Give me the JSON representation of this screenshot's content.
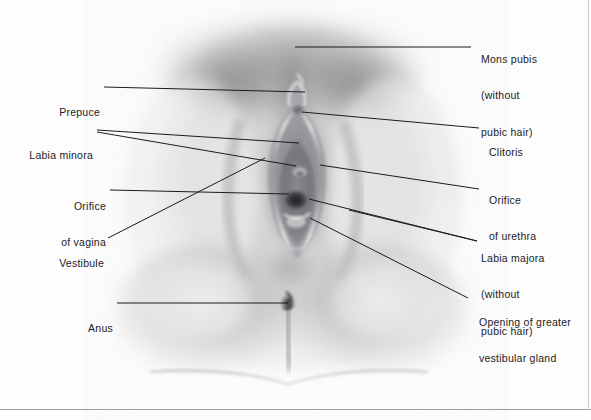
{
  "figure": {
    "type": "labeled-anatomical-drawing",
    "style": "grayscale airbrush/pencil rendering",
    "background_color": "#fdfdfd",
    "line_color": "#1b1b1f",
    "text_color": "#1b1b1f"
  },
  "labels": {
    "mons_pubis": {
      "lines": [
        "Mons pubis",
        "(without",
        "pubic hair)"
      ],
      "side": "right",
      "x": 481,
      "y": 28,
      "leader": [
        [
          295,
          47
        ],
        [
          471,
          47
        ]
      ]
    },
    "clitoris": {
      "lines": [
        "Clitoris"
      ],
      "side": "right",
      "x": 489,
      "y": 120,
      "leader": [
        [
          302,
          112
        ],
        [
          479,
          128
        ]
      ]
    },
    "orifice_of_urethra": {
      "lines": [
        "Orifice",
        "of urethra"
      ],
      "side": "right",
      "x": 489,
      "y": 168,
      "leader": [
        [
          320,
          165
        ],
        [
          479,
          189
        ]
      ]
    },
    "labia_majora": {
      "lines": [
        "Labia majora",
        "(without",
        "pubic hair)"
      ],
      "side": "right",
      "x": 481,
      "y": 226,
      "leader_a": [
        [
          309,
          199
        ],
        [
          477,
          241
        ]
      ],
      "leader_b": [
        [
          349,
          210
        ],
        [
          477,
          241
        ]
      ]
    },
    "opening_of_greater_vestibular_gland": {
      "lines": [
        "Opening of greater",
        "vestibular gland"
      ],
      "side": "right",
      "x": 479,
      "y": 290,
      "leader": [
        [
          310,
          218
        ],
        [
          468,
          298
        ]
      ]
    },
    "prepuce": {
      "lines": [
        "Prepuce"
      ],
      "side": "left",
      "x": 45,
      "y": 81,
      "leader": [
        [
          104,
          87
        ],
        [
          305,
          92
        ]
      ]
    },
    "labia_minora": {
      "lines": [
        "Labia minora"
      ],
      "side": "left",
      "x": 23,
      "y": 124,
      "leader_a": [
        [
          97,
          130
        ],
        [
          299,
          143
        ]
      ],
      "leader_b": [
        [
          97,
          132
        ],
        [
          296,
          166
        ]
      ]
    },
    "orifice_of_vagina": {
      "lines": [
        "Orifice",
        "of vagina"
      ],
      "side": "left",
      "x": 52,
      "y": 174,
      "leader": [
        [
          110,
          190
        ],
        [
          289,
          194
        ]
      ]
    },
    "vestibule": {
      "lines": [
        "Vestibule"
      ],
      "side": "left",
      "x": 46,
      "y": 232,
      "leader": [
        [
          108,
          238
        ],
        [
          265,
          158
        ]
      ]
    },
    "anus": {
      "lines": [
        "Anus"
      ],
      "side": "left",
      "x": 80,
      "y": 297,
      "leader": [
        [
          117,
          303
        ],
        [
          288,
          303
        ]
      ]
    }
  }
}
